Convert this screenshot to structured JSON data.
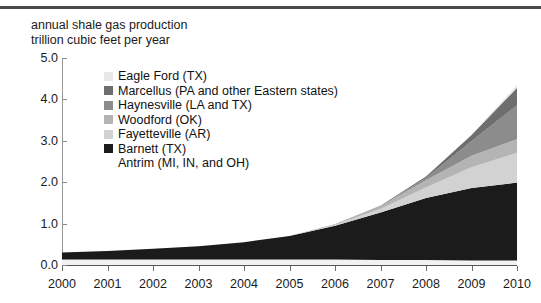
{
  "chart_data": {
    "type": "area",
    "title": "annual shale gas production",
    "subtitle": "trillion cubic feet per year",
    "xlabel": "",
    "ylabel": "trillion cubic feet per year",
    "x": [
      2000,
      2001,
      2002,
      2003,
      2004,
      2005,
      2006,
      2007,
      2008,
      2009,
      2010
    ],
    "categories": [
      "2000",
      "2001",
      "2002",
      "2003",
      "2004",
      "2005",
      "2006",
      "2007",
      "2008",
      "2009",
      "2010"
    ],
    "xlim": [
      2000,
      2010
    ],
    "ylim": [
      0.0,
      5.0
    ],
    "yticks": [
      "0.0",
      "1.0",
      "2.0",
      "3.0",
      "4.0",
      "5.0"
    ],
    "ytick_values": [
      0.0,
      1.0,
      2.0,
      3.0,
      4.0,
      5.0
    ],
    "grid": false,
    "legend_position": "upper-left-inside",
    "stacked": true,
    "stack_order_bottom_to_top": [
      "Antrim (MI, IN, and OH)",
      "Barnett (TX)",
      "Fayetteville (AR)",
      "Woodford (OK)",
      "Haynesville (LA and TX)",
      "Marcellus (PA and other Eastern states)",
      "Eagle Ford (TX)"
    ],
    "series": [
      {
        "name": "Antrim (MI, IN, and OH)",
        "color": "#f2f2f2",
        "values": [
          0.13,
          0.13,
          0.13,
          0.13,
          0.13,
          0.13,
          0.13,
          0.12,
          0.12,
          0.11,
          0.11
        ]
      },
      {
        "name": "Barnett (TX)",
        "color": "#1b1b1b",
        "values": [
          0.17,
          0.21,
          0.26,
          0.32,
          0.42,
          0.57,
          0.82,
          1.15,
          1.5,
          1.75,
          1.88
        ]
      },
      {
        "name": "Fayetteville (AR)",
        "color": "#d2d2d2",
        "values": [
          0.0,
          0.0,
          0.0,
          0.0,
          0.0,
          0.0,
          0.02,
          0.08,
          0.25,
          0.5,
          0.72
        ]
      },
      {
        "name": "Woodford (OK)",
        "color": "#b4b4b4",
        "values": [
          0.0,
          0.0,
          0.0,
          0.0,
          0.0,
          0.0,
          0.02,
          0.07,
          0.18,
          0.28,
          0.33
        ]
      },
      {
        "name": "Haynesville (LA and TX)",
        "color": "#8c8c8c",
        "values": [
          0.0,
          0.0,
          0.0,
          0.0,
          0.0,
          0.0,
          0.0,
          0.0,
          0.05,
          0.35,
          0.82
        ]
      },
      {
        "name": "Marcellus (PA and other Eastern states)",
        "color": "#6e6e6e",
        "values": [
          0.0,
          0.0,
          0.0,
          0.0,
          0.0,
          0.0,
          0.0,
          0.01,
          0.04,
          0.15,
          0.42
        ]
      },
      {
        "name": "Eagle Ford (TX)",
        "color": "#e8e8e8",
        "values": [
          0.0,
          0.0,
          0.0,
          0.0,
          0.0,
          0.0,
          0.0,
          0.0,
          0.0,
          0.02,
          0.07
        ]
      }
    ],
    "legend_entries": [
      {
        "label": "Eagle Ford (TX)",
        "color": "#e8e8e8",
        "swatch": true
      },
      {
        "label": "Marcellus (PA and other Eastern states)",
        "color": "#6e6e6e",
        "swatch": true
      },
      {
        "label": "Haynesville (LA and TX)",
        "color": "#8c8c8c",
        "swatch": true
      },
      {
        "label": "Woodford (OK)",
        "color": "#b4b4b4",
        "swatch": true
      },
      {
        "label": "Fayetteville (AR)",
        "color": "#d2d2d2",
        "swatch": true
      },
      {
        "label": "Barnett (TX)",
        "color": "#1b1b1b",
        "swatch": true
      },
      {
        "label": "Antrim (MI, IN, and OH)",
        "color": "#f2f2f2",
        "swatch": false
      }
    ]
  }
}
